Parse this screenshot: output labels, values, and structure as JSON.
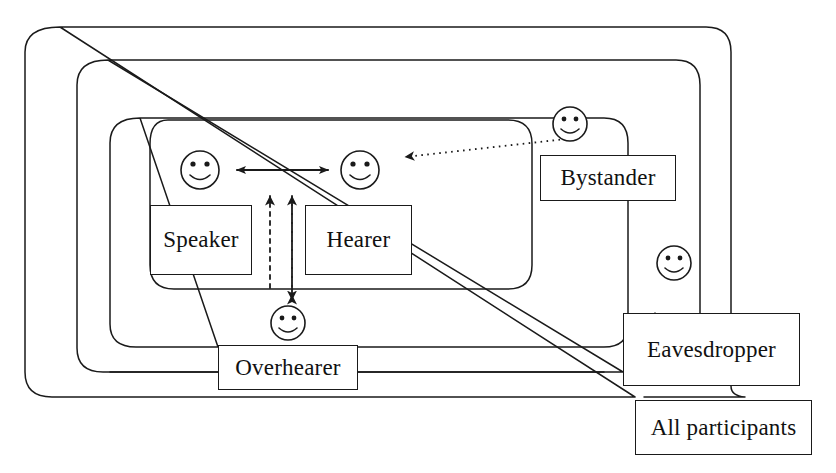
{
  "diagram": {
    "type": "nested-set-diagram",
    "stroke_color": "#1a1a1a",
    "background_color": "#ffffff",
    "inner_roles": [
      {
        "id": "speaker",
        "label": "Speaker",
        "x": 150,
        "y": 205,
        "w": 102,
        "h": 70
      },
      {
        "id": "hearer",
        "label": "Hearer",
        "x": 305,
        "y": 205,
        "w": 107,
        "h": 70
      }
    ],
    "outer_roles": [
      {
        "id": "bystander",
        "label": "Bystander",
        "x": 540,
        "y": 155,
        "w": 136,
        "h": 46
      },
      {
        "id": "overhearer",
        "label": "Overhearer",
        "x": 218,
        "y": 345,
        "w": 140,
        "h": 45
      },
      {
        "id": "eavesdropper",
        "label": "Eavesdropper",
        "x": 623,
        "y": 313,
        "w": 177,
        "h": 73
      },
      {
        "id": "all-participants",
        "label": "All participants",
        "x": 635,
        "y": 400,
        "w": 177,
        "h": 55
      }
    ],
    "faces": [
      {
        "id": "speaker-face",
        "cx": 200,
        "cy": 170,
        "r": 19
      },
      {
        "id": "hearer-face",
        "cx": 360,
        "cy": 170,
        "r": 19
      },
      {
        "id": "bystander-face",
        "cx": 570,
        "cy": 124,
        "r": 17
      },
      {
        "id": "eavesdropper-face",
        "cx": 674,
        "cy": 263,
        "r": 17
      },
      {
        "id": "overhearer-face",
        "cx": 288,
        "cy": 323,
        "r": 17
      }
    ],
    "nesting_rings": [
      {
        "id": "ring-all-participants",
        "level": 1,
        "contains": "All participants"
      },
      {
        "id": "ring-eavesdropper",
        "level": 2,
        "contains": "Eavesdropper"
      },
      {
        "id": "ring-bystander",
        "level": 3,
        "contains": "Bystander"
      },
      {
        "id": "ring-overhearer",
        "level": 3,
        "contains": "Overhearer"
      },
      {
        "id": "ring-inner-participants",
        "level": 4,
        "contains": "Speaker and Hearer"
      }
    ],
    "connectors": [
      {
        "id": "speaker-hearer-arrow",
        "style": "solid",
        "heads": "both",
        "from": "speaker-face",
        "to": "hearer-face"
      },
      {
        "id": "overhearer-up-arrow",
        "style": "dashed",
        "heads": "up",
        "from": "overhearer",
        "to": "inner-ring"
      },
      {
        "id": "overhearer-bidirectional-arrow",
        "style": "dashed",
        "heads": "both",
        "from": "overhearer",
        "to": "inner-ring"
      },
      {
        "id": "bystander-to-hearer-arrow",
        "style": "dotted",
        "heads": "left",
        "from": "bystander-face",
        "to": "hearer-face"
      }
    ]
  }
}
